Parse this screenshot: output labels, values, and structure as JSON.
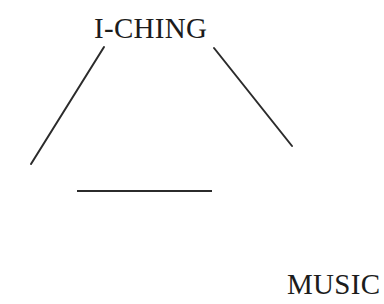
{
  "document": {
    "type": "scanned-figure",
    "background_color": "#ffffff",
    "width": 384,
    "height": 304
  },
  "diagram": {
    "stroke_color": "#2b2b2b",
    "stroke_width": 2,
    "labels": {
      "top": "I-CHING",
      "bottom_right": "MUSIC"
    },
    "lines": [
      {
        "name": "left-diagonal",
        "x1": 104,
        "y1": 47,
        "x2": 31,
        "y2": 164
      },
      {
        "name": "right-diagonal",
        "x1": 214,
        "y1": 48,
        "x2": 292,
        "y2": 146
      },
      {
        "name": "base-horizontal",
        "x1": 77,
        "y1": 191,
        "x2": 212,
        "y2": 191
      }
    ]
  }
}
